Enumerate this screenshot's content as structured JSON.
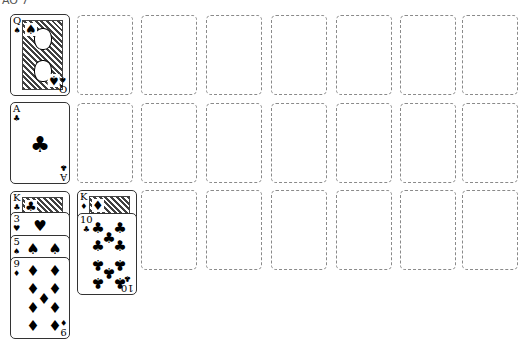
{
  "title_fragment": "AO 7",
  "colors": {
    "background": "#ffffff",
    "slot_border": "#8a8a8a",
    "card_border": "#333333",
    "ink": "#000000"
  },
  "grid": {
    "columns": 8,
    "rows": 3,
    "col_x": [
      10,
      77,
      141,
      206,
      271,
      336,
      400,
      462
    ],
    "row_y": [
      15,
      103,
      190
    ]
  },
  "foundation": [
    {
      "row": 0,
      "col": 0,
      "rank": "Q",
      "suit": "♠",
      "suit_name": "spades",
      "face": true
    },
    {
      "row": 1,
      "col": 0,
      "rank": "A",
      "suit": "♣",
      "suit_name": "clubs",
      "face": false
    }
  ],
  "tableau": [
    {
      "col": 0,
      "cards": [
        {
          "rank": "K",
          "suit": "♣",
          "suit_name": "clubs",
          "face": true
        },
        {
          "rank": "3",
          "suit": "♥",
          "suit_name": "hearts",
          "face": false
        },
        {
          "rank": "5",
          "suit": "♠",
          "suit_name": "spades",
          "face": false
        },
        {
          "rank": "9",
          "suit": "♦",
          "suit_name": "diamonds",
          "face": false
        }
      ]
    },
    {
      "col": 1,
      "cards": [
        {
          "rank": "K",
          "suit": "♦",
          "suit_name": "diamonds",
          "face": true
        },
        {
          "rank": "10",
          "suit": "♣",
          "suit_name": "clubs",
          "face": false
        }
      ]
    }
  ],
  "empty_slots_label": "empty card slot"
}
